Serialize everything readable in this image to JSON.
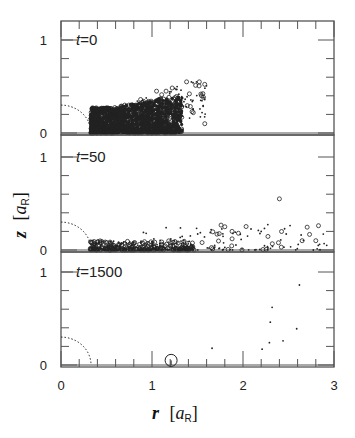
{
  "chart_data": {
    "type": "scatter",
    "title": "",
    "xlabel": "r [a_R]",
    "ylabel": "z [a_R]",
    "xlabel_var": "r",
    "ylabel_var": "z",
    "unit_main": "a",
    "unit_sub": "R",
    "xlim": [
      0,
      3
    ],
    "ylim": [
      -0.02,
      1.2
    ],
    "x_ticks_major": [
      0,
      1,
      2,
      3
    ],
    "x_ticks_minor_step": 0.2,
    "y_ticks_major": [
      0,
      1
    ],
    "y_ticks_minor_step": 0.2,
    "grid": false,
    "legend": null,
    "annotations": [
      "dotted quarter circle of radius ~0.3 a_R centered at origin in each panel"
    ],
    "panels": [
      {
        "label": "t=0",
        "label_var": "t",
        "label_value": "0",
        "description": "dense cloud of particles for r in ~0.3–1.3, z in 0–0.3, with sparser tail to r~1.6, z~0.6",
        "dense_region": {
          "r": [
            0.32,
            1.05
          ],
          "z": [
            0.0,
            0.3
          ]
        },
        "sample_points": [
          {
            "r": 0.7,
            "z": 0.3
          },
          {
            "r": 0.9,
            "z": 0.35
          },
          {
            "r": 1.05,
            "z": 0.45
          },
          {
            "r": 1.25,
            "z": 0.48
          },
          {
            "r": 1.38,
            "z": 0.55
          },
          {
            "r": 1.52,
            "z": 0.55
          },
          {
            "r": 1.55,
            "z": 0.22
          },
          {
            "r": 1.45,
            "z": 0.35
          },
          {
            "r": 1.58,
            "z": 0.1
          }
        ]
      },
      {
        "label": "t=50",
        "label_var": "t",
        "label_value": "50",
        "description": "particles spread along midplane from r~0.3 to ~2.9, z mostly < 0.2, a few up to ~0.55",
        "dense_region": {
          "r": [
            0.3,
            1.4
          ],
          "z": [
            0.0,
            0.1
          ]
        },
        "sample_points": [
          {
            "r": 1.0,
            "z": 0.05
          },
          {
            "r": 1.35,
            "z": 0.1
          },
          {
            "r": 1.55,
            "z": 0.08
          },
          {
            "r": 1.65,
            "z": 0.22
          },
          {
            "r": 1.8,
            "z": 0.25
          },
          {
            "r": 1.88,
            "z": 0.12
          },
          {
            "r": 1.95,
            "z": 0.18
          },
          {
            "r": 2.05,
            "z": 0.15
          },
          {
            "r": 2.2,
            "z": 0.2
          },
          {
            "r": 2.4,
            "z": 0.55
          },
          {
            "r": 2.45,
            "z": 0.03
          },
          {
            "r": 2.65,
            "z": 0.1
          },
          {
            "r": 2.8,
            "z": 0.1
          },
          {
            "r": 2.92,
            "z": 0.05
          }
        ]
      },
      {
        "label": "t=1500",
        "label_var": "t",
        "label_value": "1500",
        "description": "few remaining particles; one large body near r~1.2 on midplane",
        "points": [
          {
            "r": 1.21,
            "z": 0.05,
            "size": "large"
          },
          {
            "r": 1.66,
            "z": 0.18
          },
          {
            "r": 2.21,
            "z": 0.17
          },
          {
            "r": 2.29,
            "z": 0.24
          },
          {
            "r": 2.3,
            "z": 0.46
          },
          {
            "r": 2.32,
            "z": 0.62
          },
          {
            "r": 2.44,
            "z": 0.26
          },
          {
            "r": 2.59,
            "z": 0.39
          },
          {
            "r": 2.62,
            "z": 0.86
          }
        ]
      }
    ]
  },
  "ui": {
    "x_tick_labels": [
      "0",
      "1",
      "2",
      "3"
    ],
    "y_tick_labels": [
      "0",
      "1"
    ],
    "colors": {
      "ink": "#222222",
      "axis": "#555555",
      "background": "#ffffff"
    }
  }
}
